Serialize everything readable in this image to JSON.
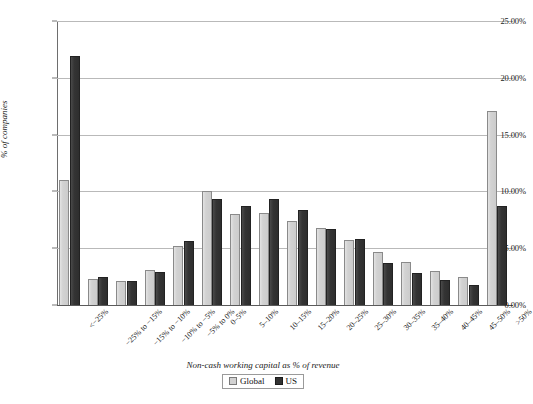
{
  "chart_data": {
    "type": "bar",
    "title": "",
    "xlabel": "Non-cash working capital as % of revenue",
    "ylabel": "% of companies",
    "ylim": [
      0,
      25
    ],
    "ytick_labels": [
      "0.00%",
      "5.00%",
      "10.00%",
      "15.00%",
      "20.00%",
      "25.00%"
    ],
    "ytick_values": [
      0,
      5,
      10,
      15,
      20,
      25
    ],
    "grid": true,
    "legend_position": "bottom",
    "categories": [
      "<−25%",
      "−25% to −15%",
      "−15% to −10%",
      "−10% to −5%",
      "−5% to 0%",
      "0–5%",
      "5–10%",
      "10–15%",
      "15–20%",
      "20–25%",
      "25–30%",
      "30–35%",
      "35–40%",
      "40–45%",
      "45–50%",
      ">50%"
    ],
    "series": [
      {
        "name": "Global",
        "color": "#d2d2d2",
        "values": [
          11.0,
          2.3,
          2.1,
          3.1,
          5.2,
          10.0,
          8.0,
          8.1,
          7.4,
          6.8,
          5.7,
          4.7,
          3.8,
          3.0,
          2.5,
          17.1
        ]
      },
      {
        "name": "US",
        "color": "#323232",
        "values": [
          21.9,
          2.5,
          2.1,
          2.9,
          5.6,
          9.3,
          8.7,
          9.3,
          8.4,
          6.7,
          5.8,
          3.7,
          2.8,
          2.2,
          1.8,
          8.7
        ]
      }
    ]
  }
}
